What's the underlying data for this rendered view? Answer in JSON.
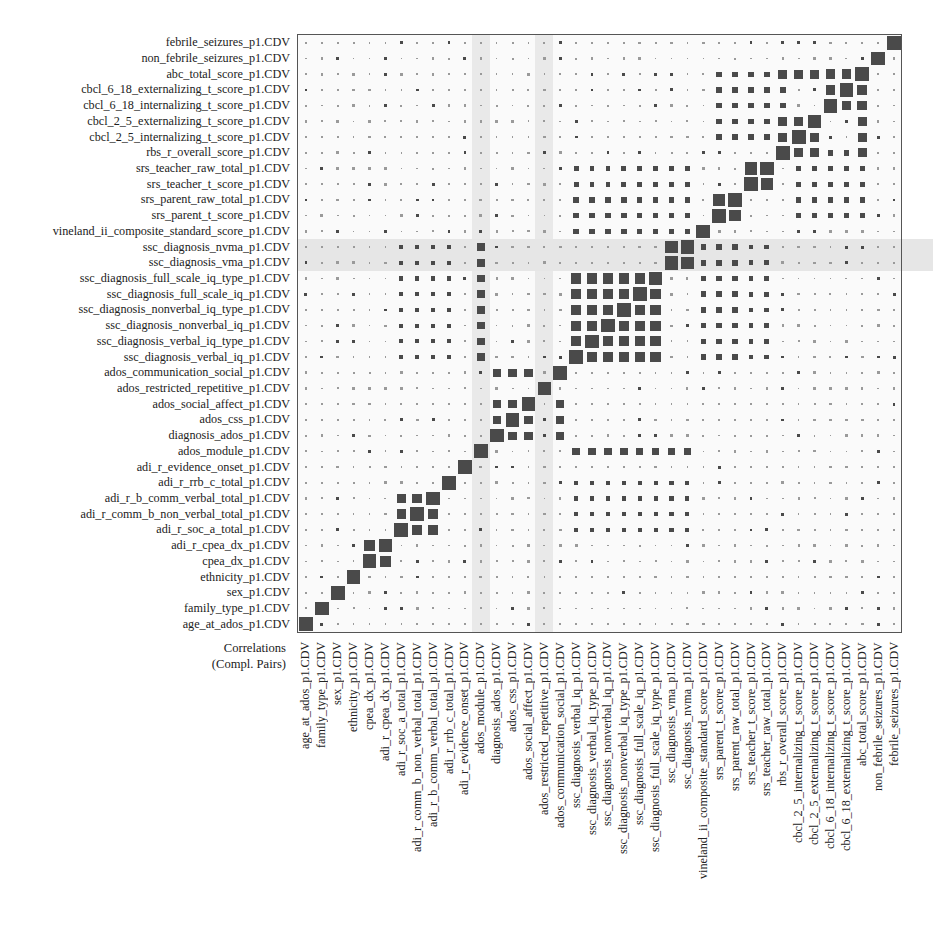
{
  "chart_data": {
    "type": "heatmap",
    "subtype": "correlation-matrix-squares",
    "title": "Correlations (Compl. Pairs)",
    "corner_label_line1": "Correlations",
    "corner_label_line2": "(Compl. Pairs)",
    "variables": [
      "age_at_ados_p1.CDV",
      "family_type_p1.CDV",
      "sex_p1.CDV",
      "ethnicity_p1.CDV",
      "cpea_dx_p1.CDV",
      "adi_r_cpea_dx_p1.CDV",
      "adi_r_soc_a_total_p1.CDV",
      "adi_r_comm_b_non_verbal_total_p1.CDV",
      "adi_r_b_comm_verbal_total_p1.CDV",
      "adi_r_rrb_c_total_p1.CDV",
      "adi_r_evidence_onset_p1.CDV",
      "ados_module_p1.CDV",
      "diagnosis_ados_p1.CDV",
      "ados_css_p1.CDV",
      "ados_social_affect_p1.CDV",
      "ados_restricted_repetitive_p1.CDV",
      "ados_communication_social_p1.CDV",
      "ssc_diagnosis_verbal_iq_p1.CDV",
      "ssc_diagnosis_verbal_iq_type_p1.CDV",
      "ssc_diagnosis_nonverbal_iq_p1.CDV",
      "ssc_diagnosis_nonverbal_iq_type_p1.CDV",
      "ssc_diagnosis_full_scale_iq_p1.CDV",
      "ssc_diagnosis_full_scale_iq_type_p1.CDV",
      "ssc_diagnosis_vma_p1.CDV",
      "ssc_diagnosis_nvma_p1.CDV",
      "vineland_ii_composite_standard_score_p1.CDV",
      "srs_parent_t_score_p1.CDV",
      "srs_parent_raw_total_p1.CDV",
      "srs_teacher_t_score_p1.CDV",
      "srs_teacher_raw_total_p1.CDV",
      "rbs_r_overall_score_p1.CDV",
      "cbcl_2_5_internalizing_t_score_p1.CDV",
      "cbcl_2_5_externalizing_t_score_p1.CDV",
      "cbcl_6_18_internalizing_t_score_p1.CDV",
      "cbcl_6_18_externalizing_t_score_p1.CDV",
      "abc_total_score_p1.CDV",
      "non_febrile_seizures_p1.CDV",
      "febrile_seizures_p1.CDV"
    ],
    "x_order": "left-to-right same as variables list",
    "y_order": "bottom-to-top same as variables list",
    "value_encoding": "absolute correlation shown as square size (0 = tiny dot, 1 = full cell)",
    "highlight_rows": [
      "ssc_diagnosis_vma_p1.CDV",
      "ssc_diagnosis_nvma_p1.CDV"
    ],
    "highlight_cols": [
      "ados_module_p1.CDV",
      "ados_restricted_repetitive_p1.CDV"
    ],
    "colors": {
      "square": "#4a4a4a",
      "background": "#fafafa",
      "band": "#e8e8e8",
      "frame": "#555555"
    },
    "strong_blocks": [
      {
        "vars": [
          "adi_r_cpea_dx_p1.CDV",
          "cpea_dx_p1.CDV"
        ],
        "approx_abs_r": 0.8
      },
      {
        "vars": [
          "adi_r_soc_a_total_p1.CDV",
          "adi_r_comm_b_non_verbal_total_p1.CDV",
          "adi_r_b_comm_verbal_total_p1.CDV"
        ],
        "approx_abs_r": 0.7
      },
      {
        "vars": [
          "ados_css_p1.CDV",
          "ados_social_affect_p1.CDV",
          "diagnosis_ados_p1.CDV",
          "ados_communication_social_p1.CDV"
        ],
        "approx_abs_r": 0.6
      },
      {
        "vars": [
          "ssc_diagnosis_verbal_iq_p1.CDV",
          "ssc_diagnosis_nonverbal_iq_p1.CDV",
          "ssc_diagnosis_full_scale_iq_p1.CDV",
          "ssc_diagnosis_verbal_iq_type_p1.CDV",
          "ssc_diagnosis_nonverbal_iq_type_p1.CDV",
          "ssc_diagnosis_full_scale_iq_type_p1.CDV"
        ],
        "approx_abs_r": 0.75
      },
      {
        "vars": [
          "ssc_diagnosis_vma_p1.CDV",
          "ssc_diagnosis_nvma_p1.CDV"
        ],
        "approx_abs_r": 0.9
      },
      {
        "vars": [
          "srs_parent_t_score_p1.CDV",
          "srs_parent_raw_total_p1.CDV"
        ],
        "approx_abs_r": 0.85
      },
      {
        "vars": [
          "srs_teacher_t_score_p1.CDV",
          "srs_teacher_raw_total_p1.CDV"
        ],
        "approx_abs_r": 0.9
      },
      {
        "vars": [
          "rbs_r_overall_score_p1.CDV",
          "cbcl_2_5_internalizing_t_score_p1.CDV",
          "cbcl_2_5_externalizing_t_score_p1.CDV",
          "abc_total_score_p1.CDV"
        ],
        "approx_abs_r": 0.65
      },
      {
        "vars": [
          "cbcl_6_18_internalizing_t_score_p1.CDV",
          "cbcl_6_18_externalizing_t_score_p1.CDV",
          "abc_total_score_p1.CDV"
        ],
        "approx_abs_r": 0.7
      }
    ]
  },
  "labels": {
    "corner_line1": "Correlations",
    "corner_line2": "(Compl. Pairs)"
  }
}
